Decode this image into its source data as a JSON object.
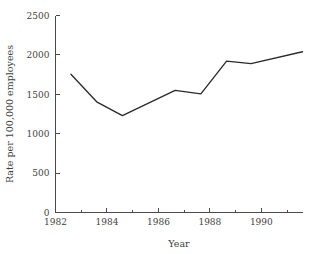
{
  "chart_data": {
    "type": "line",
    "title": "",
    "xlabel": "Year",
    "ylabel": "Rate per 100,000 employees",
    "xlim": [
      1982,
      1991.6
    ],
    "ylim": [
      0,
      2500
    ],
    "grid": false,
    "legend": null,
    "x_major_ticks": [
      1982,
      1984,
      1986,
      1988,
      1990
    ],
    "x_major_tick_labels": [
      "1982",
      "1984",
      "1986",
      "1988",
      "1990"
    ],
    "x_minor_ticks": [
      1983,
      1985,
      1987,
      1989,
      1991
    ],
    "y_ticks": [
      0,
      500,
      1000,
      1500,
      2000,
      2500
    ],
    "y_tick_labels": [
      "0",
      "500",
      "1000",
      "1500",
      "2000",
      "2500"
    ],
    "line_color": "#2b2b2b",
    "series": [
      {
        "name": "Rate per 100,000 employees",
        "x": [
          1982.6,
          1983.6,
          1984.6,
          1986.65,
          1987.65,
          1988.65,
          1989.6,
          1991.6
        ],
        "values": [
          1755,
          1405,
          1230,
          1550,
          1505,
          1920,
          1890,
          2040
        ]
      }
    ]
  },
  "axes": {
    "y_title": "Rate per 100,000 employees",
    "x_title": "Year",
    "y_labels": [
      "2500",
      "2000",
      "1500",
      "1000",
      "500",
      "0"
    ],
    "x_labels": [
      "1982",
      "1984",
      "1986",
      "1988",
      "1990"
    ]
  }
}
